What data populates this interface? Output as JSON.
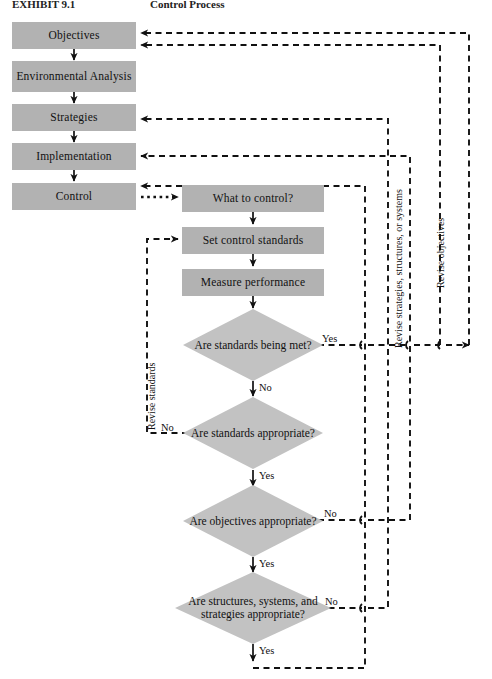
{
  "figure": {
    "caption_left": "EXHIBIT 9.1",
    "caption_right": "Control Process"
  },
  "diagram": {
    "type": "flowchart",
    "process_boxes": [
      {
        "id": "objectives",
        "label": "Objectives"
      },
      {
        "id": "environmental",
        "label": "Environmental Analysis"
      },
      {
        "id": "strategies",
        "label": "Strategies"
      },
      {
        "id": "implementation",
        "label": "Implementation"
      },
      {
        "id": "control",
        "label": "Control"
      },
      {
        "id": "what-to-control",
        "label": "What to control?"
      },
      {
        "id": "set-standards",
        "label": "Set control standards"
      },
      {
        "id": "measure-performance",
        "label": "Measure performance"
      }
    ],
    "decisions": [
      {
        "id": "standards-met",
        "label": "Are standards being met?",
        "yes": "Yes",
        "no": "No"
      },
      {
        "id": "standards-appropriate",
        "label": "Are standards appropriate?",
        "yes": "Yes",
        "no": "No"
      },
      {
        "id": "objectives-appropriate",
        "label": "Are objectives appropriate?",
        "yes": "Yes",
        "no": "No"
      },
      {
        "id": "structures-appropriate",
        "label": "Are structures, systems, and strategies appropriate?",
        "yes": "Yes",
        "no": "No"
      }
    ],
    "feedback_labels": [
      {
        "id": "revise-standards",
        "text": "Revise standards"
      },
      {
        "id": "revise-strategies",
        "text": "Revise strategies, structures, or systems"
      },
      {
        "id": "revise-objectives",
        "text": "Revise objectives"
      }
    ],
    "edge_labels": {
      "standards_met_yes": "Yes",
      "standards_met_no": "No",
      "standards_appropriate_no": "No",
      "standards_appropriate_yes": "Yes",
      "objectives_appropriate_no": "No",
      "objectives_appropriate_yes": "Yes",
      "structures_appropriate_no": "No",
      "structures_appropriate_yes": "Yes"
    },
    "colors": {
      "box_fill": "#b2b2b2",
      "diamond_fill": "#c2c2c2",
      "line": "#111111",
      "background": "#ffffff"
    }
  }
}
